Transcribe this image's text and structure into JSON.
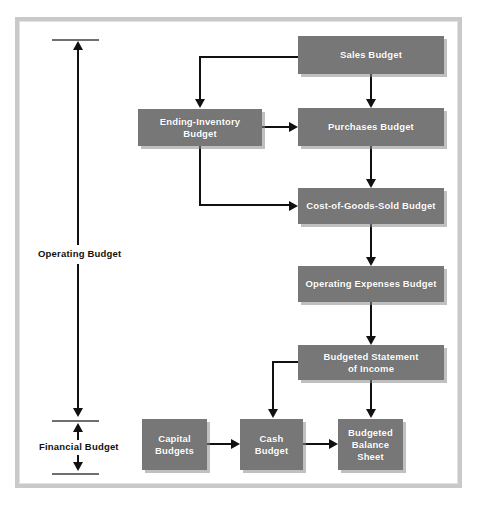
{
  "diagram": {
    "box_color": "#777777",
    "box_text_color": "#ffffff",
    "line_color": "#111111",
    "frame_color": "#c9c9c9",
    "nodes": [
      {
        "id": "sales",
        "label": "Sales Budget"
      },
      {
        "id": "ending_inv",
        "label": "Ending-Inventory\nBudget",
        "line1": "Ending-Inventory",
        "line2": "Budget"
      },
      {
        "id": "purchases",
        "label": "Purchases Budget"
      },
      {
        "id": "cogs",
        "label": "Cost-of-Goods-Sold Budget"
      },
      {
        "id": "opex",
        "label": "Operating Expenses Budget"
      },
      {
        "id": "income",
        "label": "Budgeted Statement of Income",
        "line1": "Budgeted Statement",
        "line2": "of Income"
      },
      {
        "id": "capital",
        "label": "Capital Budgets",
        "line1": "Capital",
        "line2": "Budgets"
      },
      {
        "id": "cash",
        "label": "Cash Budget",
        "line1": "Cash",
        "line2": "Budget"
      },
      {
        "id": "balance",
        "label": "Budgeted Balance Sheet",
        "line1": "Budgeted",
        "line2": "Balance",
        "line3": "Sheet"
      }
    ],
    "scale_labels": {
      "operating": "Operating Budget",
      "financial": "Financial Budget"
    },
    "edges": [
      {
        "from": "sales",
        "to": "ending_inv"
      },
      {
        "from": "sales",
        "to": "purchases"
      },
      {
        "from": "ending_inv",
        "to": "purchases"
      },
      {
        "from": "ending_inv",
        "to": "cogs"
      },
      {
        "from": "purchases",
        "to": "cogs"
      },
      {
        "from": "cogs",
        "to": "opex"
      },
      {
        "from": "opex",
        "to": "income"
      },
      {
        "from": "income",
        "to": "cash"
      },
      {
        "from": "income",
        "to": "balance"
      },
      {
        "from": "capital",
        "to": "cash"
      },
      {
        "from": "cash",
        "to": "balance"
      }
    ]
  }
}
